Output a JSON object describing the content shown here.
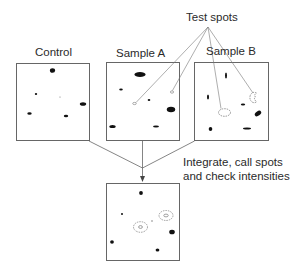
{
  "diagram": {
    "labels": {
      "control": "Control",
      "sample_a": "Sample A",
      "sample_b": "Sample B",
      "test_spots": "Test spots",
      "step_line1": "Integrate, call spots",
      "step_line2": "and check intensities"
    },
    "panels": [
      {
        "id": "control",
        "title": "Control"
      },
      {
        "id": "sample-a",
        "title": "Sample A"
      },
      {
        "id": "sample-b",
        "title": "Sample B"
      },
      {
        "id": "result",
        "title": ""
      }
    ],
    "colors": {
      "stroke": "#555555",
      "spot": "#111111",
      "test_spot": "#777777",
      "background": "#ffffff"
    }
  }
}
